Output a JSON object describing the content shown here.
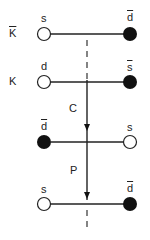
{
  "diagram": {
    "rows": [
      {
        "meson_label": "K",
        "meson_bar": true,
        "left_quark": "s",
        "left_bar": false,
        "left_filled": false,
        "right_quark": "d",
        "right_bar": true,
        "right_filled": true
      },
      {
        "meson_label": "K",
        "meson_bar": false,
        "left_quark": "d",
        "left_bar": false,
        "left_filled": false,
        "right_quark": "s",
        "right_bar": true,
        "right_filled": true
      },
      {
        "meson_label": "",
        "meson_bar": false,
        "left_quark": "d",
        "left_bar": true,
        "left_filled": true,
        "right_quark": "s",
        "right_bar": false,
        "right_filled": false
      },
      {
        "meson_label": "",
        "meson_bar": false,
        "left_quark": "s",
        "left_bar": false,
        "left_filled": false,
        "right_quark": "d",
        "right_bar": true,
        "right_filled": true
      }
    ],
    "operations": [
      {
        "label": "C"
      },
      {
        "label": "P"
      }
    ],
    "colors": {
      "line": "#222222",
      "filled": "#111111",
      "open": "#ffffff"
    }
  }
}
